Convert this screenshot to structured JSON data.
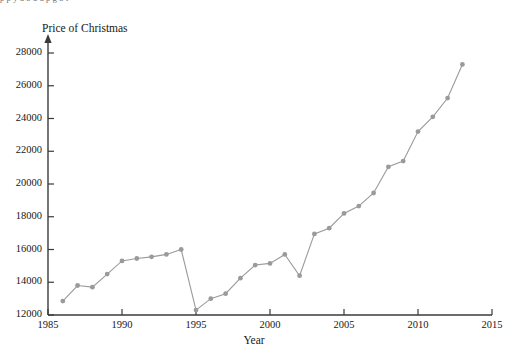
{
  "page": {
    "clipped_header_text": "p                  p                                                          y                                   d  b                 d    d            p                   g           b  f"
  },
  "chart_data": {
    "type": "line",
    "title": "",
    "ylabel": "Price of Christmas",
    "xlabel": "Year",
    "xlim": [
      1985,
      2015
    ],
    "ylim": [
      12000,
      28000
    ],
    "xticks": [
      1985,
      1990,
      1995,
      2000,
      2005,
      2010,
      2015
    ],
    "yticks": [
      12000,
      14000,
      16000,
      18000,
      20000,
      22000,
      24000,
      26000,
      28000
    ],
    "grid": false,
    "legend": "none",
    "marker": "circle",
    "series_color": "#9a9a9a",
    "axis_color": "#3a3a3a",
    "x": [
      1986,
      1987,
      1988,
      1989,
      1990,
      1991,
      1992,
      1993,
      1994,
      1995,
      1996,
      1997,
      1998,
      1999,
      2000,
      2001,
      2002,
      2003,
      2004,
      2005,
      2006,
      2007,
      2008,
      2009,
      2010,
      2011,
      2012,
      2013
    ],
    "values": [
      12850,
      13800,
      13700,
      14500,
      15300,
      15450,
      15550,
      15700,
      16000,
      12300,
      13000,
      13300,
      14250,
      15050,
      15150,
      15700,
      14400,
      16950,
      17300,
      18200,
      18650,
      19450,
      21050,
      21400,
      23200,
      24100,
      25250,
      27300
    ]
  }
}
